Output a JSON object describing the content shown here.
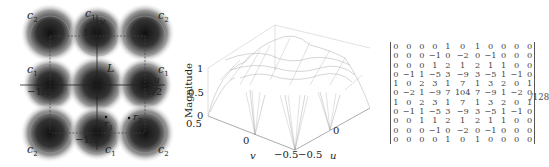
{
  "left_panel": {
    "corner_labels": {
      "c1": "c",
      "c1_sub": "1",
      "c2": "c",
      "c2_sub": "2"
    },
    "axis_u": "u",
    "axis_v": "v",
    "region_label": "L",
    "ticks": {
      "pos_half": "1/2",
      "neg_half": "−1/2"
    },
    "points": {
      "r1": "r",
      "r1_sub": "1",
      "r2": "r",
      "r2_sub": "2"
    }
  },
  "chart_data": {
    "type": "surface",
    "title": "",
    "zlabel": "Magnitude",
    "xlabel": "u",
    "ylabel": "v",
    "z_ticks": [
      "0",
      "0.5",
      "1"
    ],
    "u_ticks": [
      "−0.5",
      "0"
    ],
    "v_ticks": [
      "0.5",
      "0",
      "−0.5"
    ],
    "zlim": [
      0,
      1
    ],
    "ulim": [
      -0.5,
      0.5
    ],
    "vlim": [
      -0.5,
      0.5
    ]
  },
  "matrix": {
    "rows": [
      [
        "0",
        "0",
        "0",
        "0",
        "1",
        "0",
        "1",
        "0",
        "0",
        "0",
        "0"
      ],
      [
        "0",
        "0",
        "0",
        "−1",
        "0",
        "−2",
        "0",
        "−1",
        "0",
        "0",
        "0"
      ],
      [
        "0",
        "0",
        "0",
        "1",
        "2",
        "1",
        "2",
        "1",
        "1",
        "0",
        "0"
      ],
      [
        "0",
        "−1",
        "1",
        "−5",
        "3",
        "−9",
        "3",
        "−5",
        "1",
        "−1",
        "0"
      ],
      [
        "1",
        "0",
        "2",
        "3",
        "1",
        "7",
        "1",
        "3",
        "2",
        "0",
        "1"
      ],
      [
        "0",
        "−2",
        "1",
        "−9",
        "7",
        "104",
        "7",
        "−9",
        "1",
        "−2",
        "0"
      ],
      [
        "1",
        "0",
        "2",
        "3",
        "1",
        "7",
        "1",
        "3",
        "2",
        "0",
        "1"
      ],
      [
        "0",
        "−1",
        "1",
        "−5",
        "3",
        "−9",
        "3",
        "−5",
        "1",
        "−1",
        "0"
      ],
      [
        "0",
        "0",
        "1",
        "1",
        "2",
        "1",
        "2",
        "1",
        "1",
        "0",
        "0"
      ],
      [
        "0",
        "0",
        "0",
        "−1",
        "0",
        "−2",
        "0",
        "−1",
        "0",
        "0",
        "0"
      ],
      [
        "0",
        "0",
        "0",
        "0",
        "1",
        "0",
        "1",
        "0",
        "0",
        "0",
        "0"
      ]
    ],
    "scale": "/128"
  }
}
